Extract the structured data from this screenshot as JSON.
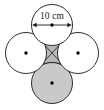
{
  "figure": {
    "name": "four-tangent-circles-diagram",
    "background_color": "#ffffff",
    "stroke_color": "#1a1a1a",
    "shade_color": "#c9c9c9",
    "shade_color_center": "#b8b8b8",
    "dimension": {
      "label": "10 cm",
      "value": 10,
      "unit": "cm",
      "measures": "diameter",
      "arrow_style": "double-headed"
    },
    "circles": [
      {
        "id": "top",
        "cx": 52,
        "cy": 25,
        "r": 20.5,
        "fill": "#ffffff",
        "center_mark": true
      },
      {
        "id": "left",
        "cx": 26,
        "cy": 53,
        "r": 20.5,
        "fill": "#ffffff",
        "center_mark": true
      },
      {
        "id": "right",
        "cx": 78,
        "cy": 53,
        "r": 20.5,
        "fill": "#ffffff",
        "center_mark": true
      },
      {
        "id": "bottom",
        "cx": 52,
        "cy": 83,
        "r": 20.5,
        "fill": "#c9c9c9",
        "center_mark": true
      }
    ],
    "center_region": {
      "id": "curvilinear-square",
      "fill": "#b8b8b8",
      "diagonals": true
    },
    "arrow": {
      "x1": 33,
      "x2": 71,
      "y": 25,
      "center_dot": true
    }
  }
}
